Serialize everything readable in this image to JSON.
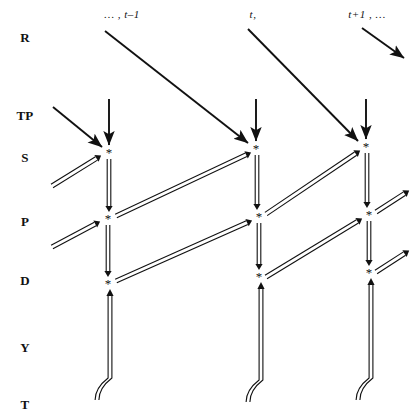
{
  "diagram": {
    "background": "#ffffff",
    "ink": "#111111",
    "node_glyph": "*",
    "width": 414,
    "height": 415
  },
  "row_labels": [
    {
      "id": "R",
      "label": "R",
      "y": 38
    },
    {
      "id": "TP",
      "label": "TP",
      "y": 116
    },
    {
      "id": "S",
      "label": "S",
      "y": 158
    },
    {
      "id": "P",
      "label": "P",
      "y": 222
    },
    {
      "id": "D",
      "label": "D",
      "y": 281
    },
    {
      "id": "Y",
      "label": "Y",
      "y": 348
    },
    {
      "id": "T",
      "label": "T",
      "y": 405
    }
  ],
  "row_label_x": 25,
  "column_headers": [
    {
      "id": "t-minus-1",
      "label": "… , t–1",
      "x": 122,
      "y": 14
    },
    {
      "id": "t",
      "label": "t,",
      "x": 253,
      "y": 14
    },
    {
      "id": "t-plus-1",
      "label": "t+1 , …",
      "x": 367,
      "y": 14
    }
  ],
  "columns": [
    {
      "id": "col-t-minus-1",
      "x_s": 109,
      "x_p": 108,
      "x_d": 108,
      "x_y": 110,
      "x_t": 109
    },
    {
      "id": "col-t",
      "x_s": 256,
      "x_p": 259,
      "x_d": 259,
      "x_y": 261,
      "x_t": 260
    },
    {
      "id": "col-t-plus-1",
      "x_s": 366,
      "x_p": 369,
      "x_d": 369,
      "x_y": 371,
      "x_t": 370
    }
  ],
  "nodes": [
    {
      "id": "s-t-minus-1",
      "row": "S",
      "col": "t-1",
      "x": 109,
      "y": 152
    },
    {
      "id": "p-t-minus-1",
      "row": "P",
      "col": "t-1",
      "x": 108,
      "y": 218
    },
    {
      "id": "d-t-minus-1",
      "row": "D",
      "col": "t-1",
      "x": 108,
      "y": 283
    },
    {
      "id": "s-t",
      "row": "S",
      "col": "t",
      "x": 256,
      "y": 148
    },
    {
      "id": "p-t",
      "row": "P",
      "col": "t",
      "x": 259,
      "y": 216
    },
    {
      "id": "d-t",
      "row": "D",
      "col": "t",
      "x": 259,
      "y": 276
    },
    {
      "id": "s-t-plus-1",
      "row": "S",
      "col": "t+1",
      "x": 366,
      "y": 146
    },
    {
      "id": "p-t-plus-1",
      "row": "P",
      "col": "t+1",
      "x": 369,
      "y": 214
    },
    {
      "id": "d-t-plus-1",
      "row": "D",
      "col": "t+1",
      "x": 369,
      "y": 272
    }
  ],
  "edges": {
    "single": [
      {
        "id": "r-tminus1-to-s-t",
        "x1": 105,
        "y1": 31,
        "x2": 248,
        "y2": 143,
        "note": "R at t-1 to S at t"
      },
      {
        "id": "r-t-to-s-tplus1",
        "x1": 248,
        "y1": 29,
        "x2": 358,
        "y2": 141,
        "note": "R at t to S at t+1"
      },
      {
        "id": "r-tplus1-outgoing",
        "x1": 362,
        "y1": 28,
        "x2": 404,
        "y2": 58,
        "note": "R at t+1 outgoing"
      },
      {
        "id": "tp-in-from-left",
        "x1": 53,
        "y1": 107,
        "x2": 102,
        "y2": 147,
        "note": "incoming to S at t-1"
      },
      {
        "id": "tp-vert-t-minus-1",
        "x1": 109,
        "y1": 99,
        "x2": 109,
        "y2": 145,
        "note": "TP down to S t-1"
      },
      {
        "id": "tp-vert-t",
        "x1": 256,
        "y1": 99,
        "x2": 256,
        "y2": 141,
        "note": "TP down to S t"
      },
      {
        "id": "tp-vert-t-plus-1",
        "x1": 366,
        "y1": 99,
        "x2": 366,
        "y2": 139,
        "note": "TP down to S t+1"
      }
    ],
    "double_vertical": [
      {
        "id": "s-to-p-t-minus-1",
        "x": 109,
        "y1": 159,
        "y2": 212
      },
      {
        "id": "p-to-d-t-minus-1",
        "x": 108,
        "y1": 225,
        "y2": 277
      },
      {
        "id": "s-to-p-t",
        "x": 257,
        "y1": 155,
        "y2": 210
      },
      {
        "id": "p-to-d-t",
        "x": 259,
        "y1": 223,
        "y2": 270
      },
      {
        "id": "s-to-p-t-plus-1",
        "x": 367,
        "y1": 153,
        "y2": 208
      },
      {
        "id": "p-to-d-t-plus-1",
        "x": 369,
        "y1": 221,
        "y2": 266
      }
    ],
    "double_diagonal": [
      {
        "id": "in-to-s-t-minus-1",
        "x1": 52,
        "y1": 186,
        "x2": 102,
        "y2": 155
      },
      {
        "id": "in-to-p-t-minus-1",
        "x1": 52,
        "y1": 247,
        "x2": 101,
        "y2": 221
      },
      {
        "id": "s-tminus1-to-p-t",
        "x1": 116,
        "y1": 216,
        "x2": 252,
        "y2": 152
      },
      {
        "id": "p-tminus1-to-d-t",
        "x1": 116,
        "y1": 281,
        "x2": 253,
        "y2": 220
      },
      {
        "id": "s-t-to-p-tplus1",
        "x1": 266,
        "y1": 214,
        "x2": 361,
        "y2": 150
      },
      {
        "id": "p-t-to-d-tplus1",
        "x1": 266,
        "y1": 277,
        "x2": 363,
        "y2": 218
      },
      {
        "id": "s-tplus1-out",
        "x1": 376,
        "y1": 212,
        "x2": 410,
        "y2": 190
      },
      {
        "id": "p-tplus1-out",
        "x1": 376,
        "y1": 272,
        "x2": 410,
        "y2": 250
      }
    ],
    "double_up_from_t": [
      {
        "id": "t-to-d-t-minus-1",
        "x": 110,
        "y_top": 289,
        "y_bottom": 400,
        "curve_dx": -13
      },
      {
        "id": "t-to-d-t",
        "x": 261,
        "y_top": 282,
        "y_bottom": 402,
        "curve_dx": -13
      },
      {
        "id": "t-to-d-t-plus-1",
        "x": 371,
        "y_top": 278,
        "y_bottom": 400,
        "curve_dx": -13
      }
    ]
  }
}
